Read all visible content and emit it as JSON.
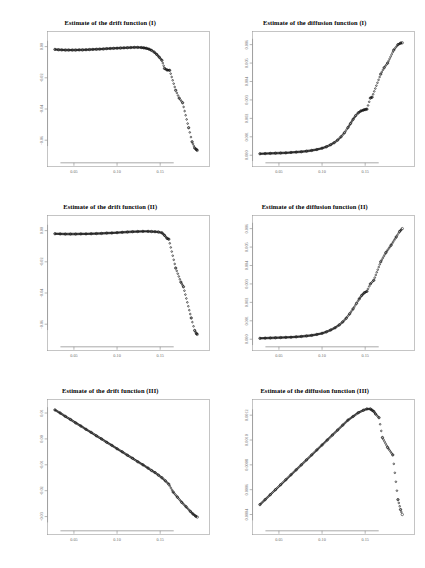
{
  "figure": {
    "background": "#ffffff",
    "layout": "3 rows x 2 columns of scatter panels",
    "point_color": "#111111",
    "axis_color": "#808080",
    "tick_label_color": "#6b6b6b"
  },
  "panels": [
    {
      "id": "drift-1",
      "title": "Estimate of the drift function (I)",
      "xticks": [
        "0.05",
        "0.10",
        "0.15"
      ],
      "yticks": [
        "0.00",
        "-0.02",
        "-0.04",
        "-0.06"
      ]
    },
    {
      "id": "diffusion-1",
      "title": "Estimate of the diffusion function (I)",
      "xticks": [
        "0.05",
        "0.10",
        "0.15"
      ],
      "yticks": [
        "0.000",
        "0.001",
        "0.002",
        "0.003",
        "0.004",
        "0.005",
        "0.006"
      ]
    },
    {
      "id": "drift-2",
      "title": "Estimate of the drift function (II)",
      "xticks": [
        "0.05",
        "0.10",
        "0.15"
      ],
      "yticks": [
        "0.00",
        "-0.02",
        "-0.04",
        "-0.06"
      ]
    },
    {
      "id": "diffusion-2",
      "title": "Estimate of the diffusion function (II)",
      "xticks": [
        "0.05",
        "0.10",
        "0.15"
      ],
      "yticks": [
        "0.000",
        "0.001",
        "0.002",
        "0.003",
        "0.004",
        "0.005",
        "0.006"
      ]
    },
    {
      "id": "drift-3",
      "title": "Estimate of the drift function (III)",
      "xticks": [
        "0.05",
        "0.10",
        "0.15"
      ],
      "yticks": [
        "0.01",
        "0.00",
        "-0.01",
        "-0.02",
        "-0.03"
      ]
    },
    {
      "id": "diffusion-3",
      "title": "Estimate of the diffusion function (III)",
      "xticks": [
        "0.05",
        "0.10",
        "0.15"
      ],
      "yticks": [
        "0.0004",
        "0.0006",
        "0.0008",
        "0.0010",
        "0.0012"
      ]
    }
  ],
  "chart_data": [
    {
      "type": "scatter",
      "title": "Estimate of the drift function (I)",
      "xlabel": "",
      "ylabel": "",
      "xlim": [
        0.025,
        0.195
      ],
      "ylim": [
        -0.072,
        0.006
      ],
      "xticks": [
        0.05,
        0.1,
        0.15
      ],
      "yticks": [
        0.0,
        -0.02,
        -0.04,
        -0.06
      ],
      "grid": false,
      "legend": "none",
      "description": "Nearly flat near zero until x~0.14, then falls off steeply with scattered points",
      "x": [
        0.028,
        0.032,
        0.036,
        0.04,
        0.044,
        0.048,
        0.052,
        0.056,
        0.06,
        0.064,
        0.068,
        0.072,
        0.076,
        0.08,
        0.084,
        0.088,
        0.092,
        0.096,
        0.1,
        0.104,
        0.108,
        0.112,
        0.116,
        0.12,
        0.124,
        0.128,
        0.131,
        0.134,
        0.137,
        0.14,
        0.143,
        0.146,
        0.149,
        0.152,
        0.155,
        0.158,
        0.161,
        0.168,
        0.172,
        0.176,
        0.183,
        0.187,
        0.19,
        0.192,
        0.193
      ],
      "y": [
        -0.0018,
        -0.002,
        -0.0021,
        -0.0022,
        -0.0022,
        -0.0022,
        -0.0022,
        -0.0021,
        -0.0021,
        -0.002,
        -0.0019,
        -0.0018,
        -0.0017,
        -0.0016,
        -0.0015,
        -0.0013,
        -0.0012,
        -0.0011,
        -0.001,
        -0.0009,
        -0.0008,
        -0.0007,
        -0.0006,
        -0.0005,
        -0.0005,
        -0.0006,
        -0.0008,
        -0.0011,
        -0.0016,
        -0.0024,
        -0.0035,
        -0.005,
        -0.0068,
        -0.0088,
        -0.014,
        -0.015,
        -0.0152,
        -0.028,
        -0.033,
        -0.036,
        -0.052,
        -0.061,
        -0.065,
        -0.066,
        -0.0665
      ]
    },
    {
      "type": "scatter",
      "title": "Estimate of the diffusion function (I)",
      "xlabel": "",
      "ylabel": "",
      "xlim": [
        0.025,
        0.195
      ],
      "ylim": [
        -0.0002,
        0.0064
      ],
      "xticks": [
        0.05,
        0.1,
        0.15
      ],
      "yticks": [
        0.0,
        0.001,
        0.002,
        0.003,
        0.004,
        0.005,
        0.006
      ],
      "grid": false,
      "legend": "none",
      "description": "Flat near zero then convex increase, rising steeply after x~0.13",
      "x": [
        0.028,
        0.034,
        0.04,
        0.046,
        0.052,
        0.058,
        0.064,
        0.07,
        0.076,
        0.082,
        0.088,
        0.094,
        0.1,
        0.105,
        0.11,
        0.114,
        0.118,
        0.122,
        0.126,
        0.13,
        0.133,
        0.136,
        0.139,
        0.142,
        0.145,
        0.148,
        0.15,
        0.152,
        0.156,
        0.158,
        0.168,
        0.172,
        0.176,
        0.183,
        0.188,
        0.191,
        0.193
      ],
      "y": [
        8e-05,
        9e-05,
        0.0001,
        0.00011,
        0.00012,
        0.00013,
        0.00015,
        0.00017,
        0.00019,
        0.00022,
        0.00026,
        0.00031,
        0.00038,
        0.00046,
        0.00057,
        0.00068,
        0.00082,
        0.001,
        0.00122,
        0.0015,
        0.00172,
        0.00195,
        0.00215,
        0.0023,
        0.0024,
        0.00245,
        0.00248,
        0.0025,
        0.0031,
        0.00315,
        0.0044,
        0.00475,
        0.005,
        0.0057,
        0.006,
        0.00608,
        0.0061
      ]
    },
    {
      "type": "scatter",
      "title": "Estimate of the drift function (II)",
      "xlabel": "",
      "ylabel": "",
      "xlim": [
        0.025,
        0.195
      ],
      "ylim": [
        -0.072,
        0.006
      ],
      "xticks": [
        0.05,
        0.1,
        0.15
      ],
      "yticks": [
        0.0,
        -0.02,
        -0.04,
        -0.06
      ],
      "grid": false,
      "legend": "none",
      "description": "Flat near zero to x~0.15, then abrupt drop with isolated scattered points",
      "x": [
        0.028,
        0.034,
        0.04,
        0.046,
        0.052,
        0.058,
        0.064,
        0.07,
        0.076,
        0.082,
        0.088,
        0.094,
        0.1,
        0.106,
        0.112,
        0.118,
        0.124,
        0.13,
        0.136,
        0.14,
        0.144,
        0.148,
        0.152,
        0.155,
        0.158,
        0.16,
        0.168,
        0.174,
        0.177,
        0.186,
        0.19,
        0.192,
        0.193
      ],
      "y": [
        -0.002,
        -0.0021,
        -0.0022,
        -0.0022,
        -0.0022,
        -0.0021,
        -0.0021,
        -0.002,
        -0.0019,
        -0.0018,
        -0.0016,
        -0.0015,
        -0.0013,
        -0.0011,
        -0.0009,
        -0.0007,
        -0.0006,
        -0.0005,
        -0.0005,
        -0.0006,
        -0.0007,
        -0.0009,
        -0.0014,
        -0.003,
        -0.005,
        -0.0055,
        -0.024,
        -0.033,
        -0.036,
        -0.056,
        -0.064,
        -0.066,
        -0.0665
      ]
    },
    {
      "type": "scatter",
      "title": "Estimate of the diffusion function (II)",
      "xlabel": "",
      "ylabel": "",
      "xlim": [
        0.025,
        0.195
      ],
      "ylim": [
        -0.0002,
        0.0064
      ],
      "xticks": [
        0.05,
        0.1,
        0.15
      ],
      "yticks": [
        0.0,
        0.001,
        0.002,
        0.003,
        0.004,
        0.005,
        0.006
      ],
      "grid": false,
      "legend": "none",
      "description": "Flat near zero then smooth convex rise to about 0.006 at the right edge",
      "x": [
        0.028,
        0.034,
        0.04,
        0.046,
        0.052,
        0.058,
        0.064,
        0.07,
        0.076,
        0.082,
        0.088,
        0.094,
        0.1,
        0.105,
        0.11,
        0.115,
        0.12,
        0.124,
        0.128,
        0.132,
        0.136,
        0.14,
        0.143,
        0.146,
        0.149,
        0.152,
        0.156,
        0.16,
        0.168,
        0.174,
        0.18,
        0.186,
        0.19,
        0.193
      ],
      "y": [
        5e-05,
        6e-05,
        7e-05,
        8e-05,
        9e-05,
        0.0001,
        0.00011,
        0.00013,
        0.00015,
        0.00018,
        0.00021,
        0.00026,
        0.00032,
        0.0004,
        0.0005,
        0.00062,
        0.00078,
        0.00094,
        0.00114,
        0.00138,
        0.00165,
        0.00195,
        0.00218,
        0.00238,
        0.00252,
        0.0026,
        0.003,
        0.0032,
        0.0042,
        0.0047,
        0.0051,
        0.00555,
        0.00585,
        0.006
      ]
    },
    {
      "type": "scatter",
      "title": "Estimate of the drift function (III)",
      "xlabel": "",
      "ylabel": "",
      "xlim": [
        0.025,
        0.195
      ],
      "ylim": [
        -0.034,
        0.013
      ],
      "xticks": [
        0.05,
        0.1,
        0.15
      ],
      "yticks": [
        0.01,
        0.0,
        -0.01,
        -0.02,
        -0.03
      ],
      "grid": false,
      "legend": "none",
      "description": "Dense straight line decreasing linearly from about 0.011 to -0.030 across the x range",
      "x": [
        0.028,
        0.034,
        0.04,
        0.046,
        0.052,
        0.058,
        0.064,
        0.07,
        0.076,
        0.082,
        0.088,
        0.094,
        0.1,
        0.106,
        0.112,
        0.118,
        0.124,
        0.13,
        0.136,
        0.14,
        0.144,
        0.148,
        0.152,
        0.156,
        0.16,
        0.165,
        0.17,
        0.175,
        0.18,
        0.185,
        0.188,
        0.191,
        0.193
      ],
      "y": [
        0.0112,
        0.01,
        0.0087,
        0.0075,
        0.0062,
        0.005,
        0.0037,
        0.0025,
        0.0012,
        0.0,
        -0.0013,
        -0.0025,
        -0.0038,
        -0.005,
        -0.0063,
        -0.0075,
        -0.0088,
        -0.01,
        -0.0113,
        -0.0122,
        -0.013,
        -0.014,
        -0.015,
        -0.0162,
        -0.0175,
        -0.0205,
        -0.0225,
        -0.0245,
        -0.0262,
        -0.028,
        -0.029,
        -0.0298,
        -0.0302
      ]
    },
    {
      "type": "scatter",
      "title": "Estimate of the diffusion function (III)",
      "xlabel": "",
      "ylabel": "",
      "xlim": [
        0.025,
        0.195
      ],
      "ylim": [
        0.0003,
        0.00128
      ],
      "xticks": [
        0.05,
        0.1,
        0.15
      ],
      "yticks": [
        0.0004,
        0.0006,
        0.0008,
        0.001,
        0.0012
      ],
      "grid": false,
      "legend": "none",
      "description": "Rises nearly linearly to a peak near x=0.16 then drops sharply with scattered outliers",
      "x": [
        0.028,
        0.034,
        0.04,
        0.046,
        0.052,
        0.058,
        0.064,
        0.07,
        0.076,
        0.082,
        0.088,
        0.094,
        0.1,
        0.106,
        0.112,
        0.118,
        0.124,
        0.13,
        0.136,
        0.142,
        0.148,
        0.152,
        0.156,
        0.158,
        0.16,
        0.162,
        0.166,
        0.17,
        0.176,
        0.182,
        0.188,
        0.191,
        0.193
      ],
      "y": [
        0.00048,
        0.00052,
        0.00056,
        0.0006,
        0.00064,
        0.00068,
        0.00072,
        0.00076,
        0.0008,
        0.00084,
        0.00088,
        0.00092,
        0.00096,
        0.001,
        0.00104,
        0.00108,
        0.00112,
        0.00116,
        0.00119,
        0.00122,
        0.00124,
        0.00125,
        0.00125,
        0.00124,
        0.00123,
        0.00121,
        0.00118,
        0.00102,
        0.00094,
        0.00088,
        0.00052,
        0.00044,
        0.0004
      ]
    }
  ]
}
